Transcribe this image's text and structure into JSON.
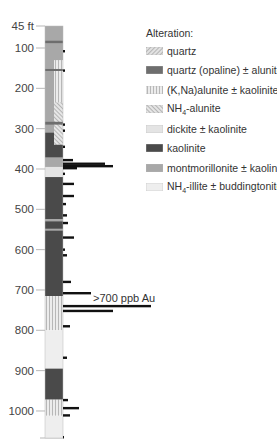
{
  "depth_axis": {
    "unit": "ft",
    "top_label": "45 ft",
    "ticks": [
      {
        "depth": 45,
        "label": "45 ft"
      },
      {
        "depth": 100,
        "label": "100"
      },
      {
        "depth": 200,
        "label": "200"
      },
      {
        "depth": 300,
        "label": "300"
      },
      {
        "depth": 400,
        "label": "400"
      },
      {
        "depth": 500,
        "label": "500"
      },
      {
        "depth": 600,
        "label": "600"
      },
      {
        "depth": 700,
        "label": "700"
      },
      {
        "depth": 800,
        "label": "800"
      },
      {
        "depth": 900,
        "label": "900"
      },
      {
        "depth": 1000,
        "label": "1000"
      }
    ]
  },
  "legend": {
    "title": "Alteration:",
    "items": [
      {
        "key": "quartz",
        "label": "quartz",
        "fill": "#d8d8d8",
        "pattern": "diag-fine"
      },
      {
        "key": "opaline",
        "label": "quartz (opaline) ± alunite",
        "fill": "#6e6e6e",
        "pattern": "solid"
      },
      {
        "key": "kna_alunite",
        "label": "(K,Na)alunite ± kaolinite",
        "fill": "#e6e6e6",
        "pattern": "vertical"
      },
      {
        "key": "nh4_alunite",
        "label": "NH4-alunite",
        "fill": "#e0e0e0",
        "pattern": "cross"
      },
      {
        "key": "dickite",
        "label": "dickite ± kaolinite",
        "fill": "#e4e4e4",
        "pattern": "solid"
      },
      {
        "key": "kaolinite",
        "label": "kaolinite",
        "fill": "#4a4a4a",
        "pattern": "solid"
      },
      {
        "key": "montmorillonite",
        "label": "montmorillonite ± kaolinite",
        "fill": "#a8a8a8",
        "pattern": "solid"
      },
      {
        "key": "nh4_illite",
        "label": "NH4-illite ± buddingtonite",
        "fill": "#eeeeee",
        "pattern": "solid"
      }
    ]
  },
  "annotation": {
    "text": ">700 ppb Au"
  },
  "column": {
    "layers": [
      {
        "from": 45,
        "to": 340,
        "unit": "montmorillonite"
      },
      {
        "from": 82,
        "to": 88,
        "unit": "opaline"
      },
      {
        "from": 130,
        "to": 340,
        "unit": "kna_alunite",
        "half": "right"
      },
      {
        "from": 152,
        "to": 157,
        "unit": "opaline"
      },
      {
        "from": 235,
        "to": 340,
        "unit": "nh4_alunite",
        "half": "right"
      },
      {
        "from": 283,
        "to": 290,
        "unit": "opaline"
      },
      {
        "from": 310,
        "to": 372,
        "unit": "kaolinite",
        "half": "left"
      },
      {
        "from": 340,
        "to": 372,
        "unit": "kaolinite",
        "half": "right"
      },
      {
        "from": 372,
        "to": 395,
        "unit": "montmorillonite"
      },
      {
        "from": 395,
        "to": 420,
        "unit": "dickite"
      },
      {
        "from": 420,
        "to": 715,
        "unit": "kaolinite"
      },
      {
        "from": 524,
        "to": 530,
        "unit": "montmorillonite"
      },
      {
        "from": 548,
        "to": 553,
        "unit": "montmorillonite"
      },
      {
        "from": 715,
        "to": 800,
        "unit": "kna_alunite"
      },
      {
        "from": 800,
        "to": 895,
        "unit": "nh4_illite"
      },
      {
        "from": 895,
        "to": 972,
        "unit": "kaolinite"
      },
      {
        "from": 972,
        "to": 1012,
        "unit": "kna_alunite"
      },
      {
        "from": 1012,
        "to": 1068,
        "unit": "nh4_illite"
      }
    ]
  },
  "au_bars": [
    {
      "depth": 108,
      "len": 2
    },
    {
      "depth": 156,
      "len": 2
    },
    {
      "depth": 290,
      "len": 2
    },
    {
      "depth": 305,
      "len": 2
    },
    {
      "depth": 345,
      "len": 2
    },
    {
      "depth": 378,
      "len": 10
    },
    {
      "depth": 387,
      "len": 42
    },
    {
      "depth": 393,
      "len": 50
    },
    {
      "depth": 398,
      "len": 14
    },
    {
      "depth": 412,
      "len": 2
    },
    {
      "depth": 437,
      "len": 11
    },
    {
      "depth": 467,
      "len": 11
    },
    {
      "depth": 487,
      "len": 3
    },
    {
      "depth": 515,
      "len": 4
    },
    {
      "depth": 534,
      "len": 5
    },
    {
      "depth": 570,
      "len": 11
    },
    {
      "depth": 600,
      "len": 2
    },
    {
      "depth": 614,
      "len": 4
    },
    {
      "depth": 680,
      "len": 8
    },
    {
      "depth": 708,
      "len": 28
    },
    {
      "depth": 740,
      "len": 88
    },
    {
      "depth": 752,
      "len": 50
    },
    {
      "depth": 790,
      "len": 7
    },
    {
      "depth": 868,
      "len": 4
    },
    {
      "depth": 973,
      "len": 5
    },
    {
      "depth": 993,
      "len": 16
    },
    {
      "depth": 1011,
      "len": 7
    },
    {
      "depth": 1065,
      "len": 1
    }
  ]
}
